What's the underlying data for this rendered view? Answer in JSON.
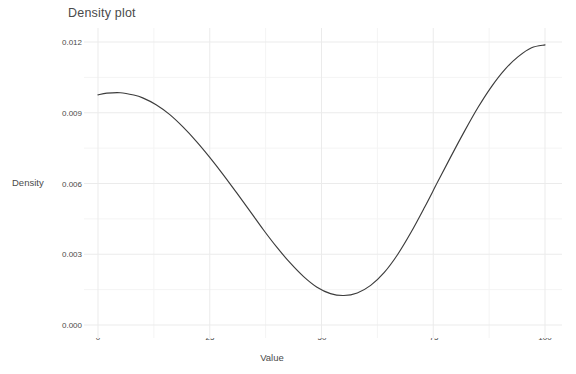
{
  "chart_data": {
    "type": "line",
    "title": "Density plot",
    "xlabel": "Value",
    "ylabel": "Density",
    "xlim": [
      0,
      100
    ],
    "ylim": [
      0.0,
      0.0125
    ],
    "xticks": [
      0,
      25,
      50,
      75,
      100
    ],
    "xtick_labels": [
      "0",
      "25",
      "50",
      "75",
      "100"
    ],
    "yticks": [
      0.0,
      0.003,
      0.006,
      0.009,
      0.012
    ],
    "ytick_labels": [
      "0.000",
      "0.003",
      "0.006",
      "0.009",
      "0.012"
    ],
    "grid": true,
    "grid_minor": true,
    "legend": "none",
    "line_color": "#3c3c3c",
    "grid_color": "#ebebeb",
    "background": "#ffffff",
    "series": [
      {
        "name": "density",
        "x": [
          0,
          2,
          5,
          8,
          10,
          13,
          16,
          19,
          22,
          25,
          28,
          31,
          34,
          37,
          40,
          43,
          46,
          49,
          52,
          55,
          58,
          61,
          64,
          67,
          70,
          73,
          76,
          79,
          82,
          85,
          88,
          91,
          94,
          97,
          100
        ],
        "y": [
          0.00976,
          0.00983,
          0.00985,
          0.00975,
          0.00963,
          0.00934,
          0.00893,
          0.0084,
          0.00779,
          0.00711,
          0.00638,
          0.00561,
          0.00483,
          0.00404,
          0.0033,
          0.00263,
          0.00205,
          0.0016,
          0.00133,
          0.00125,
          0.00136,
          0.00168,
          0.00222,
          0.00298,
          0.00392,
          0.00497,
          0.00607,
          0.00716,
          0.00822,
          0.00922,
          0.0101,
          0.01083,
          0.01138,
          0.01176,
          0.01188
        ]
      }
    ],
    "annotations": {
      "left_peak_value": 0.00985,
      "left_peak_x": 5,
      "trough_value": 0.00125,
      "trough_x": 55,
      "right_peak_value": 0.01188,
      "right_peak_x": 98
    }
  }
}
